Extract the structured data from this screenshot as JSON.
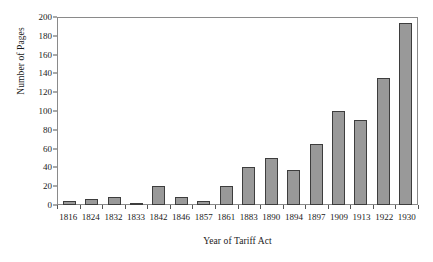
{
  "chart_data": {
    "type": "bar",
    "title": "",
    "xlabel": "Year of Tariff Act",
    "ylabel": "Number of Pages",
    "categories": [
      "1816",
      "1824",
      "1832",
      "1833",
      "1842",
      "1846",
      "1857",
      "1861",
      "1883",
      "1890",
      "1894",
      "1897",
      "1909",
      "1913",
      "1922",
      "1930"
    ],
    "values": [
      4,
      6,
      8,
      2,
      20,
      8,
      4,
      20,
      40,
      50,
      37,
      65,
      100,
      90,
      135,
      194
    ],
    "series": [
      {
        "name": "Number of Pages",
        "values": [
          4,
          6,
          8,
          2,
          20,
          8,
          4,
          20,
          40,
          50,
          37,
          65,
          100,
          90,
          135,
          194
        ]
      }
    ],
    "ylim": [
      0,
      200
    ],
    "ytick_labels": [
      "0",
      "20",
      "40",
      "60",
      "80",
      "100",
      "120",
      "140",
      "160",
      "180",
      "200"
    ],
    "ytick_values": [
      0,
      20,
      40,
      60,
      80,
      100,
      120,
      140,
      160,
      180,
      200
    ],
    "xlim_categories": 16,
    "grid": false,
    "legend": false,
    "legend_position": "none",
    "bar_color": "#999999",
    "bar_border_color": "#3d3d3d",
    "axis_color": "#8a8a8a",
    "background_color": "#ffffff",
    "text_color": "#1a1a1a"
  }
}
